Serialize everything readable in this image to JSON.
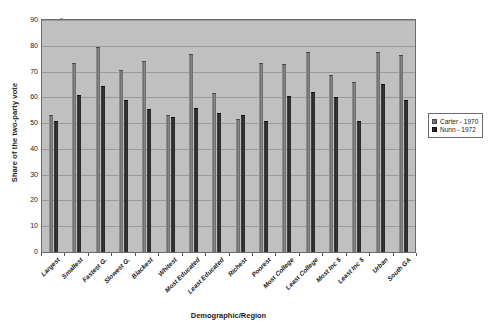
{
  "chart_data": {
    "type": "bar",
    "title": "",
    "xlabel": "Demographic/Region",
    "ylabel": "Share of the two-party vote",
    "ylim": [
      0,
      90
    ],
    "ytick_step": 10,
    "yticks": [
      0,
      10,
      20,
      30,
      40,
      50,
      60,
      70,
      80,
      90
    ],
    "grid": true,
    "legend_position": "right",
    "categories": [
      "Largest",
      "Smallest",
      "Fastest G.",
      "Slowest G.",
      "Blackest",
      "Whitest",
      "Most Educated",
      "Least Educated",
      "Richest",
      "Poorest",
      "Most College",
      "Least College",
      "Most Inc $",
      "Least Inc $",
      "Urban",
      "South GA"
    ],
    "series": [
      {
        "name": "Carter - 1970",
        "color": "#6e6e6e",
        "values": [
          53,
          73.5,
          79.5,
          70.5,
          74,
          53,
          77,
          61.5,
          51.5,
          73.5,
          73,
          77.5,
          68.5,
          66,
          77.5,
          76.5
        ]
      },
      {
        "name": "Nunn - 1972",
        "color": "#262626",
        "values": [
          51,
          61,
          64.5,
          59,
          55.5,
          52.5,
          56,
          54,
          53,
          51,
          60.5,
          62,
          60,
          51,
          65,
          59
        ]
      }
    ],
    "extra_pairs_note": ""
  },
  "legend": {
    "items": [
      {
        "label": "Carter - 1970",
        "swatch": "carter-swatch"
      },
      {
        "label": "Nunn - 1972",
        "swatch": "nunn-swatch"
      }
    ]
  },
  "axes": {
    "y_title": "Share of the two-party vote",
    "x_title": "Demographic/Region"
  }
}
